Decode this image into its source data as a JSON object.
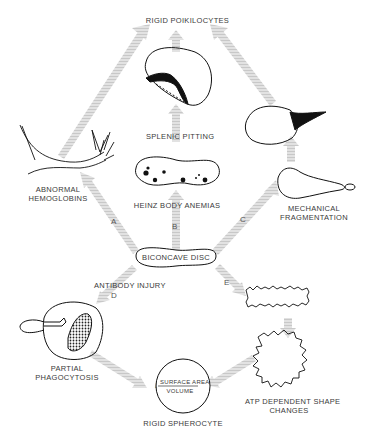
{
  "diagram": {
    "nodes": {
      "top": "RIGID POIKILOCYTES",
      "splenic": "SPLENIC PITTING",
      "abnormal_1": "ABNORMAL",
      "abnormal_2": "HEMOGLOBINS",
      "heinz": "HEINZ BODY ANEMIAS",
      "mech_1": "MECHANICAL",
      "mech_2": "FRAGMENTATION",
      "disc": "BICONCAVE DISC",
      "antibody": "ANTIBODY INJURY",
      "partial_1": "PARTIAL",
      "partial_2": "PHAGOCYTOSIS",
      "atp_1": "ATP DEPENDENT SHAPE",
      "atp_2": "CHANGES",
      "spherocyte": "RIGID SPHEROCYTE",
      "ratio_num": "SURFACE AREA",
      "ratio_den": "VOLUME",
      "ratio_arrow": "↓"
    },
    "pathways": [
      "A",
      "B",
      "C",
      "D",
      "E"
    ],
    "colors": {
      "arrow": "#d4d4d4",
      "ink": "#111111",
      "text": "#3a3a3a"
    }
  }
}
